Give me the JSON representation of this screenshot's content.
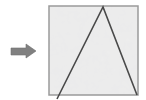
{
  "figure": {
    "background_color": "#ffffff",
    "width": 146,
    "height": 100,
    "arrow": {
      "name": "right-arrow",
      "direction": "right",
      "color": "#808080",
      "outline_color": "#6e6e6e",
      "shaft": {
        "x": 11,
        "y": 48,
        "width": 17,
        "height": 7
      },
      "head": {
        "tip_x": 36,
        "center_y": 51,
        "back_x": 26,
        "half_height": 7
      }
    },
    "square": {
      "name": "textured-square",
      "x": 49,
      "y": 6,
      "width": 89,
      "height": 89,
      "fill_color": "#ededed",
      "stroke_color": "#9a9a9a",
      "stroke_width": 1.5,
      "texture": "mottled-marble",
      "texture_color": "#d8d8d8"
    },
    "triangle": {
      "name": "inscribed-triangle",
      "stroke_color": "#4a4a4a",
      "stroke_width": 1.6,
      "fill": "none",
      "apex": {
        "x": 103,
        "y": 7
      },
      "bottom_left": {
        "x": 57,
        "y": 99
      },
      "bottom_right": {
        "x": 137,
        "y": 95
      }
    }
  }
}
